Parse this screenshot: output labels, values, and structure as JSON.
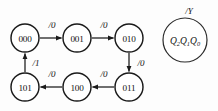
{
  "diagram": {
    "type": "finite-state-machine",
    "states": [
      {
        "id": "s000",
        "label": "000",
        "cx": 25,
        "cy": 38,
        "r": 14
      },
      {
        "id": "s001",
        "label": "001",
        "cx": 77,
        "cy": 38,
        "r": 14
      },
      {
        "id": "s010",
        "label": "010",
        "cx": 129,
        "cy": 38,
        "r": 14
      },
      {
        "id": "s011",
        "label": "011",
        "cx": 129,
        "cy": 87,
        "r": 14
      },
      {
        "id": "s100",
        "label": "100",
        "cx": 77,
        "cy": 87,
        "r": 14
      },
      {
        "id": "s101",
        "label": "101",
        "cx": 25,
        "cy": 87,
        "r": 14
      }
    ],
    "transitions": [
      {
        "id": "t1",
        "from": "000",
        "to": "001",
        "label": "/0",
        "label_x": 52,
        "label_y": 25
      },
      {
        "id": "t2",
        "from": "001",
        "to": "010",
        "label": "/0",
        "label_x": 104,
        "label_y": 25
      },
      {
        "id": "t3",
        "from": "010",
        "to": "011",
        "label": "/0",
        "label_x": 141,
        "label_y": 63
      },
      {
        "id": "t4",
        "from": "011",
        "to": "100",
        "label": "/0",
        "label_x": 104,
        "label_y": 74
      },
      {
        "id": "t5",
        "from": "100",
        "to": "101",
        "label": "/0",
        "label_x": 52,
        "label_y": 74
      },
      {
        "id": "t6",
        "from": "101",
        "to": "000",
        "label": "/1",
        "label_x": 36,
        "label_y": 63
      }
    ],
    "legend": {
      "output_label": "/Y",
      "output_label_x": 189,
      "output_label_y": 11,
      "state_vars": [
        {
          "base": "Q",
          "sub": "2"
        },
        {
          "base": "Q",
          "sub": "1"
        },
        {
          "base": "Q",
          "sub": "0"
        }
      ],
      "cx": 185,
      "cy": 40,
      "r": 22
    },
    "colors": {
      "stroke": "#1a1a1a",
      "fill": "#ffffff",
      "background": "#fdfdfd",
      "text": "#111111"
    }
  }
}
